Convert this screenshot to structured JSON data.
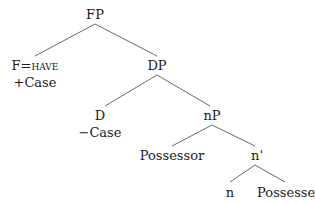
{
  "tree": {
    "nodes": {
      "FP": {
        "label": "FP",
        "x": 95,
        "y": 14
      },
      "F": {
        "label_prefix": "F=",
        "label_sc": "have",
        "x": 35,
        "y": 65
      },
      "F_feature": {
        "label": "+Case",
        "x": 35,
        "y": 82
      },
      "DP": {
        "label": "DP",
        "x": 157,
        "y": 65
      },
      "D": {
        "label": "D",
        "x": 100,
        "y": 115
      },
      "D_feature": {
        "label": "−Case",
        "x": 100,
        "y": 132
      },
      "nP": {
        "label": "nP",
        "x": 212,
        "y": 115
      },
      "Possessor": {
        "label": "Possessor",
        "x": 172,
        "y": 155
      },
      "n_bar": {
        "label": "n'",
        "x": 257,
        "y": 155
      },
      "n": {
        "label": "n",
        "x": 230,
        "y": 192
      },
      "Possessee": {
        "label": "Possessee",
        "x": 290,
        "y": 192
      }
    },
    "edges": [
      {
        "from": "FP",
        "to": "F",
        "x1": 95,
        "y1": 24,
        "x2": 35,
        "y2": 56
      },
      {
        "from": "FP",
        "to": "DP",
        "x1": 95,
        "y1": 24,
        "x2": 157,
        "y2": 56
      },
      {
        "from": "DP",
        "to": "D",
        "x1": 157,
        "y1": 75,
        "x2": 105,
        "y2": 106
      },
      {
        "from": "DP",
        "to": "nP",
        "x1": 157,
        "y1": 75,
        "x2": 210,
        "y2": 106
      },
      {
        "from": "nP",
        "to": "Possessor",
        "x1": 212,
        "y1": 125,
        "x2": 172,
        "y2": 146
      },
      {
        "from": "nP",
        "to": "n_bar",
        "x1": 212,
        "y1": 125,
        "x2": 255,
        "y2": 146
      },
      {
        "from": "n_bar",
        "to": "n",
        "x1": 255,
        "y1": 165,
        "x2": 230,
        "y2": 182
      },
      {
        "from": "n_bar",
        "to": "Possessee",
        "x1": 255,
        "y1": 165,
        "x2": 285,
        "y2": 182
      }
    ],
    "edge_color": "#6a6a6a",
    "text_color": "#1a1a1a"
  }
}
